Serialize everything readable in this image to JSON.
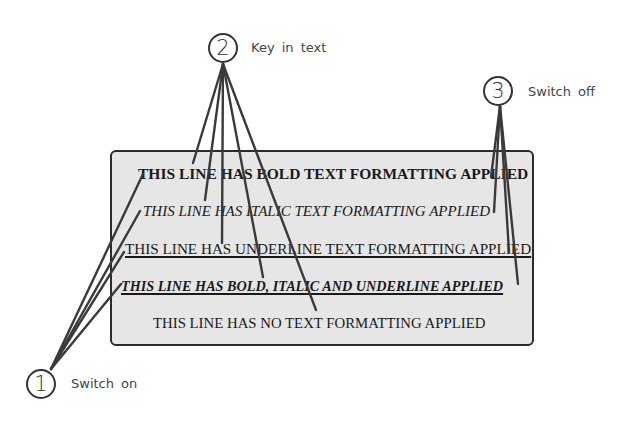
{
  "diagram": {
    "panel": {
      "background": "#e6e6e6",
      "border": "#2b2b2b",
      "lines": [
        {
          "text": "THIS LINE HAS BOLD TEXT FORMATTING APPLIED",
          "format": "bold"
        },
        {
          "text": "THIS LINE HAS ITALIC TEXT FORMATTING APPLIED",
          "format": "italic"
        },
        {
          "text": "THIS LINE HAS UNDERLINE TEXT FORMATTING APPLIED",
          "format": "underline"
        },
        {
          "text": "THIS LINE HAS BOLD, ITALIC AND UNDERLINE APPLIED",
          "format": "bold-italic-underline"
        },
        {
          "text": "THIS LINE HAS NO TEXT FORMATTING APPLIED",
          "format": "none"
        }
      ]
    },
    "callouts": [
      {
        "number": "1",
        "label": "Switch on"
      },
      {
        "number": "2",
        "label": "Key in text"
      },
      {
        "number": "3",
        "label": "Switch off"
      }
    ],
    "leader_color": "#3a3a3a"
  }
}
